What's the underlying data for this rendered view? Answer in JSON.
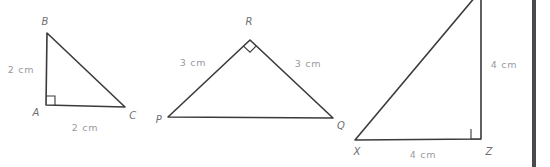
{
  "figure": {
    "background_color": "#ffffff",
    "stroke_color": "#3a3a3e",
    "vertex_label_color": "#6e6e74",
    "measure_label_color": "#9a9aa0",
    "width": 550,
    "height": 167
  },
  "triangles": [
    {
      "id": "triangle-abc",
      "name": "Triangle ABC",
      "right_angle_at": "A",
      "vertices": [
        {
          "label": "A",
          "x": 46,
          "y": 105,
          "label_x": 36,
          "label_y": 113
        },
        {
          "label": "B",
          "x": 47,
          "y": 33,
          "label_x": 45,
          "label_y": 22
        },
        {
          "label": "C",
          "x": 125,
          "y": 107,
          "label_x": 133,
          "label_y": 116
        }
      ],
      "path": "M 47 33 L 46 105 L 125 107 Z",
      "measures": [
        {
          "text": "2 cm",
          "x": 21,
          "y": 70,
          "side": "AB"
        },
        {
          "text": "2 cm",
          "x": 85,
          "y": 128,
          "side": "AC"
        }
      ],
      "right_angle_mark": "M 46 96 L 55 96 L 55 105"
    },
    {
      "id": "triangle-pqr",
      "name": "Triangle PQR",
      "right_angle_at": "R",
      "vertices": [
        {
          "label": "P",
          "x": 168,
          "y": 117,
          "label_x": 159,
          "label_y": 120
        },
        {
          "label": "R",
          "x": 250,
          "y": 40,
          "label_x": 249,
          "label_y": 22
        },
        {
          "label": "Q",
          "x": 333,
          "y": 118,
          "label_x": 341,
          "label_y": 126
        }
      ],
      "path": "M 168 117 L 250 40 L 333 118 Z",
      "measures": [
        {
          "text": "3 cm",
          "x": 193,
          "y": 63,
          "side": "PR"
        },
        {
          "text": "3 cm",
          "x": 308,
          "y": 64,
          "side": "RQ"
        }
      ],
      "right_angle_mark": "M 243.5 46.1 L 250 52.2 L 256.3 45.9"
    },
    {
      "id": "triangle-xyz",
      "name": "Triangle XYZ",
      "right_angle_at": "Z",
      "vertices": [
        {
          "label": "X",
          "x": 355,
          "y": 140,
          "label_x": 357,
          "label_y": 152
        },
        {
          "label": "Y",
          "x": 481,
          "y": -10,
          "label_x": 481,
          "label_y": -18
        },
        {
          "label": "Z",
          "x": 481,
          "y": 139,
          "label_x": 489,
          "label_y": 152
        }
      ],
      "path": "M 355 140 L 481 -10 L 481 139 Z",
      "measures": [
        {
          "text": "4 cm",
          "x": 504,
          "y": 65,
          "side": "YZ"
        },
        {
          "text": "4 cm",
          "x": 423,
          "y": 155,
          "side": "XZ"
        }
      ],
      "right_angle_mark": "M 471 129 L 471 139 L 481 139"
    }
  ],
  "divider": {
    "name": "panel-divider",
    "x": 534,
    "y1": 0,
    "y2": 167,
    "color": "#4a4a4e"
  }
}
